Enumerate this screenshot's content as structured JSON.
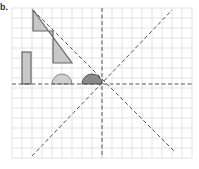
{
  "problem_label": "b.",
  "grid": {
    "x0": 12,
    "y0": 8,
    "cols": 18,
    "rows": 15,
    "cell": 10,
    "line_color": "#dcdcdc"
  },
  "axes": {
    "center_x": 102,
    "center_y": 84,
    "line_color": "#555555"
  },
  "shapes": {
    "rectangle": {
      "x": 22,
      "y": 52,
      "w": 9,
      "h": 32,
      "fill": "#c8c8c8",
      "stroke": "#666666"
    },
    "step_triangle": {
      "points": "33,10 33,31 53,31 53,63 72,63 33,10",
      "fill": "#c8c8c8",
      "stroke": "#666666"
    },
    "light_semicircle": {
      "cx": 62,
      "cy": 84,
      "r": 10,
      "fill": "#cfcfcf",
      "stroke": "#888888"
    },
    "dark_semicircle": {
      "cx": 92,
      "cy": 84,
      "r": 10,
      "fill": "#8a8a8a",
      "stroke": "#555555"
    }
  }
}
